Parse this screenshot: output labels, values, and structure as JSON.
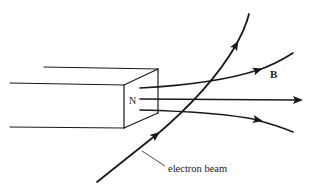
{
  "diagram": {
    "type": "physics-illustration",
    "magnet": {
      "pole_label": "N"
    },
    "field": {
      "label": "B",
      "line_count": 3
    },
    "electron_beam": {
      "label": "electron beam"
    },
    "colors": {
      "stroke": "#1a1a1a",
      "background": "#ffffff"
    }
  }
}
